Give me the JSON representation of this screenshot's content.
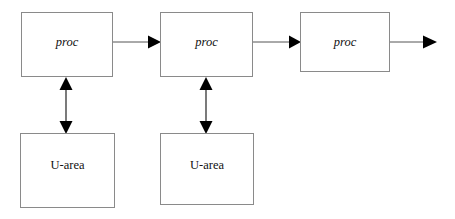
{
  "diagram": {
    "background_color": "#ffffff",
    "box_border_color": "#8a8a8a",
    "arrow_color": "#000000",
    "nodes": [
      {
        "id": "proc-1",
        "label": "proc",
        "style": "italic",
        "x": 21,
        "y": 12,
        "width": 92,
        "height": 65
      },
      {
        "id": "proc-2",
        "label": "proc",
        "style": "italic",
        "x": 160,
        "y": 12,
        "width": 93,
        "height": 65
      },
      {
        "id": "proc-3",
        "label": "proc",
        "style": "italic",
        "x": 300,
        "y": 12,
        "width": 90,
        "height": 60
      },
      {
        "id": "uarea-1",
        "label": "U-area",
        "style": "roman",
        "x": 20,
        "y": 133,
        "width": 95,
        "height": 75
      },
      {
        "id": "uarea-2",
        "label": "U-area",
        "style": "roman",
        "x": 160,
        "y": 133,
        "width": 94,
        "height": 72
      }
    ],
    "edges": [
      {
        "id": "edge-proc1-proc2",
        "from": "proc-1",
        "to": "proc-2",
        "direction": "single",
        "orientation": "horizontal"
      },
      {
        "id": "edge-proc2-proc3",
        "from": "proc-2",
        "to": "proc-3",
        "direction": "single",
        "orientation": "horizontal"
      },
      {
        "id": "edge-proc3-out",
        "from": "proc-3",
        "to": "",
        "direction": "single",
        "orientation": "horizontal"
      },
      {
        "id": "edge-proc1-uarea1",
        "from": "proc-1",
        "to": "uarea-1",
        "direction": "double",
        "orientation": "vertical"
      },
      {
        "id": "edge-proc2-uarea2",
        "from": "proc-2",
        "to": "uarea-2",
        "direction": "double",
        "orientation": "vertical"
      }
    ]
  }
}
